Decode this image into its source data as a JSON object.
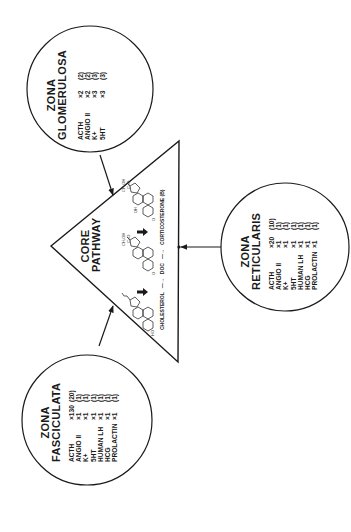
{
  "diagram": {
    "core": {
      "title_line1": "CORE",
      "title_line2": "PATHWAY",
      "pathway": [
        {
          "label": "CHOLESTEROL"
        },
        {
          "arrow": "—→"
        },
        {
          "label": "DOC"
        },
        {
          "arrow": "—→"
        },
        {
          "label": "CORTICOSTERONE (B)"
        }
      ],
      "steps": {
        "cholesterol": "CHOLESTEROL",
        "arrow1": "—→",
        "doc": "DOC",
        "arrow2": "—→",
        "corticosterone": "CORTICOSTERONE (B)"
      },
      "structure_labels": {
        "ho": "HO",
        "o1": "O",
        "o2": "O",
        "oh": "OH",
        "ch2oh_1": "CH₂OH",
        "co_1": "C=O",
        "ch2oh_2": "CH₂OH",
        "co_2": "C=O"
      }
    },
    "zones": {
      "glomerulosa": {
        "title_line1": "ZONA",
        "title_line2": "GLOMERULOSA",
        "rows": [
          {
            "hormone": "ACTH",
            "fold": "×2",
            "paren": "(2)"
          },
          {
            "hormone": "ANGIO II",
            "fold": "×2",
            "paren": "(2)"
          },
          {
            "hormone": "K+",
            "fold": "×3",
            "paren": "(3)"
          },
          {
            "hormone": "5HT",
            "fold": "×3",
            "paren": "(3)"
          }
        ]
      },
      "fasciculata": {
        "title_line1": "ZONA",
        "title_line2": "FASCICULATA",
        "rows": [
          {
            "hormone": "ACTH",
            "fold": "×130",
            "paren": "(20)"
          },
          {
            "hormone": "ANGIO II",
            "fold": "×1",
            "paren": "(1)"
          },
          {
            "hormone": "K+",
            "fold": "×1",
            "paren": "(1)"
          },
          {
            "hormone": "5HT",
            "fold": "×1",
            "paren": "(1)"
          },
          {
            "hormone": "HUMAN LH",
            "fold": "×1",
            "paren": "(1)"
          },
          {
            "hormone": "HCG",
            "fold": "×1",
            "paren": "(1)"
          },
          {
            "hormone": "PROLACTIN",
            "fold": "×1",
            "paren": "(1)"
          }
        ]
      },
      "reticularis": {
        "title_line1": "ZONA",
        "title_line2": "RETICULARIS",
        "rows": [
          {
            "hormone": "ACTH",
            "fold": "×20",
            "paren": "(10)"
          },
          {
            "hormone": "ANGIO II",
            "fold": "×1",
            "paren": "(1)"
          },
          {
            "hormone": "K+",
            "fold": "×1",
            "paren": "(1)"
          },
          {
            "hormone": "5HT",
            "fold": "×1",
            "paren": "(1)"
          },
          {
            "hormone": "HUMAN LH",
            "fold": "×1",
            "paren": "(1)"
          },
          {
            "hormone": "HCG",
            "fold": "×1",
            "paren": "(1)"
          },
          {
            "hormone": "PROLACTIN",
            "fold": "×1",
            "paren": "(1)"
          }
        ]
      }
    },
    "colors": {
      "ink": "#1a1a1a",
      "background": "#ffffff"
    }
  }
}
